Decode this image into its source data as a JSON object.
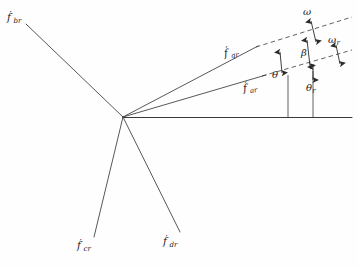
{
  "figure": {
    "type": "vector-angle-diagram",
    "background_color": "#fefefe",
    "line_color": "#3a3a3a",
    "text_color": "#1a1a1a"
  },
  "vertex": {
    "x": 123,
    "y": 117
  },
  "vectors": [
    {
      "id": "f-br",
      "base": "f",
      "subscript": "br",
      "prime": "′",
      "label_x": 7,
      "label_y": 13,
      "end_x": 30,
      "end_y": 28,
      "direction": "upper-left"
    },
    {
      "id": "f-qr",
      "base": "f",
      "subscript": "qr",
      "prime": "′",
      "label_x": 224,
      "label_y": 50,
      "end_x": 256,
      "end_y": 47,
      "direction": "upper-right-steep"
    },
    {
      "id": "f-ar",
      "base": "f",
      "subscript": "ar",
      "prime": "′",
      "label_x": 243,
      "label_y": 85,
      "end_x": 262,
      "end_y": 76,
      "direction": "upper-right-shallow"
    },
    {
      "id": "f-cr",
      "base": "f",
      "subscript": "cr",
      "prime": "′",
      "label_x": 77,
      "label_y": 241,
      "end_x": 95,
      "end_y": 236,
      "direction": "lower-left"
    },
    {
      "id": "f-dr",
      "base": "f",
      "subscript": "dr",
      "prime": "′",
      "label_x": 163,
      "label_y": 237,
      "end_x": 179,
      "end_y": 231,
      "direction": "lower-right"
    }
  ],
  "angles": [
    {
      "id": "omega",
      "symbol": "ω",
      "subscript": "",
      "label_x": 303,
      "label_y": 8
    },
    {
      "id": "beta",
      "symbol": "β",
      "subscript": "",
      "label_x": 301,
      "label_y": 49
    },
    {
      "id": "omega-r",
      "symbol": "ω",
      "subscript": "r",
      "label_x": 328,
      "label_y": 36
    },
    {
      "id": "theta",
      "symbol": "θ",
      "subscript": "",
      "label_x": 272,
      "label_y": 72
    },
    {
      "id": "theta-r",
      "symbol": "θ",
      "subscript": "r",
      "label_x": 306,
      "label_y": 84
    }
  ],
  "baseline": {
    "x1": 123,
    "y1": 118,
    "x2": 352,
    "y2": 118
  },
  "reference_ticks": [
    {
      "id": "tick-theta",
      "x": 288,
      "y_top": 74,
      "y_bottom": 118
    },
    {
      "id": "tick-theta-r",
      "x": 313,
      "y_top": 70,
      "y_bottom": 118
    }
  ]
}
